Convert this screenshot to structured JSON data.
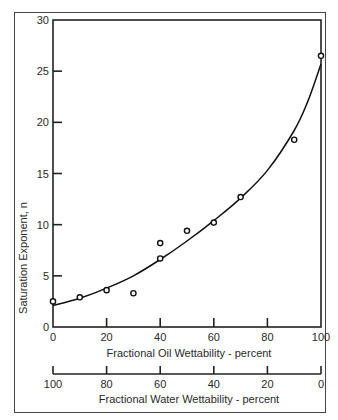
{
  "chart_data": {
    "type": "scatter",
    "title": "",
    "xlabel": "Fractional Oil Wettability -  percent",
    "x2label": "Fractional Water Wettability -   percent",
    "ylabel": "Saturation Exponent, n",
    "xlim": [
      0,
      100
    ],
    "ylim": [
      0,
      30
    ],
    "x_ticks": [
      0,
      20,
      40,
      60,
      80,
      100
    ],
    "x2_ticks": [
      100,
      80,
      60,
      40,
      20,
      0
    ],
    "y_ticks": [
      0,
      5,
      10,
      15,
      20,
      25,
      30
    ],
    "grid": false,
    "legend": null,
    "series": [
      {
        "name": "Measured",
        "marker": "open-circle",
        "points": [
          {
            "x": 0,
            "y": 2.5
          },
          {
            "x": 10,
            "y": 2.9
          },
          {
            "x": 20,
            "y": 3.6
          },
          {
            "x": 30,
            "y": 3.3
          },
          {
            "x": 40,
            "y": 8.2
          },
          {
            "x": 40,
            "y": 6.7
          },
          {
            "x": 50,
            "y": 9.4
          },
          {
            "x": 60,
            "y": 10.2
          },
          {
            "x": 70,
            "y": 12.7
          },
          {
            "x": 90,
            "y": 18.3
          },
          {
            "x": 100,
            "y": 26.5
          }
        ]
      },
      {
        "name": "Fitted curve",
        "marker": "line",
        "points": [
          {
            "x": 0,
            "y": 2.1
          },
          {
            "x": 10,
            "y": 2.8
          },
          {
            "x": 20,
            "y": 3.8
          },
          {
            "x": 30,
            "y": 5.0
          },
          {
            "x": 40,
            "y": 6.6
          },
          {
            "x": 50,
            "y": 8.4
          },
          {
            "x": 60,
            "y": 10.4
          },
          {
            "x": 70,
            "y": 12.6
          },
          {
            "x": 80,
            "y": 15.3
          },
          {
            "x": 90,
            "y": 19.2
          },
          {
            "x": 95,
            "y": 22.0
          },
          {
            "x": 100,
            "y": 25.7
          }
        ]
      }
    ]
  },
  "labels": {
    "xlabel": "Fractional Oil Wettability -  percent",
    "x2label": "Fractional Water Wettability -   percent",
    "ylabel": "Saturation Exponent, n"
  }
}
